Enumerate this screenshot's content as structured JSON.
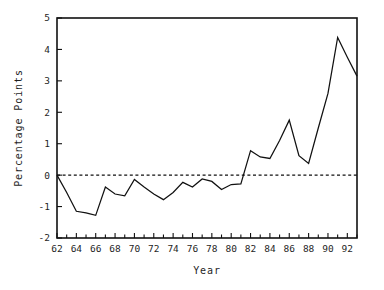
{
  "chart_data": {
    "type": "line",
    "title": "",
    "xlabel": "Year",
    "ylabel": "Percentage Points",
    "xlim": [
      62,
      93
    ],
    "ylim": [
      -2,
      5
    ],
    "grid": false,
    "legend": null,
    "x_tick_labels": [
      "62",
      "64",
      "66",
      "68",
      "70",
      "72",
      "74",
      "76",
      "78",
      "80",
      "82",
      "84",
      "86",
      "88",
      "90",
      "92"
    ],
    "x_tick_values": [
      62,
      64,
      66,
      68,
      70,
      72,
      74,
      76,
      78,
      80,
      82,
      84,
      86,
      88,
      90,
      92
    ],
    "x_minor_tick_values": [
      63,
      65,
      67,
      69,
      71,
      73,
      75,
      77,
      79,
      81,
      83,
      85,
      87,
      89,
      91,
      93
    ],
    "y_tick_labels": [
      "-2",
      "-1",
      "0",
      "1",
      "2",
      "3",
      "4",
      "5"
    ],
    "y_tick_values": [
      -2,
      -1,
      0,
      1,
      2,
      3,
      4,
      5
    ],
    "annotations": [
      {
        "name": "zero-reference-line",
        "type": "hline",
        "y": 0,
        "style": "dashed"
      }
    ],
    "series": [
      {
        "name": "percentage-points",
        "style": "solid",
        "color": "#111111",
        "x": [
          62,
          63,
          64,
          65,
          66,
          67,
          68,
          69,
          70,
          71,
          72,
          73,
          74,
          75,
          76,
          77,
          78,
          79,
          80,
          81,
          82,
          83,
          84,
          85,
          86,
          87,
          88,
          89,
          90,
          91,
          92,
          93
        ],
        "values": [
          0.0,
          -0.55,
          -1.15,
          -1.2,
          -1.28,
          -0.38,
          -0.6,
          -0.66,
          -0.14,
          -0.38,
          -0.6,
          -0.78,
          -0.55,
          -0.23,
          -0.38,
          -0.12,
          -0.2,
          -0.46,
          -0.3,
          -0.28,
          0.78,
          0.58,
          0.53,
          1.1,
          1.75,
          0.62,
          0.37,
          1.5,
          2.6,
          4.38,
          3.75,
          3.15
        ]
      }
    ]
  },
  "axis_titles": {
    "x": "Year",
    "y": "Percentage Points"
  }
}
